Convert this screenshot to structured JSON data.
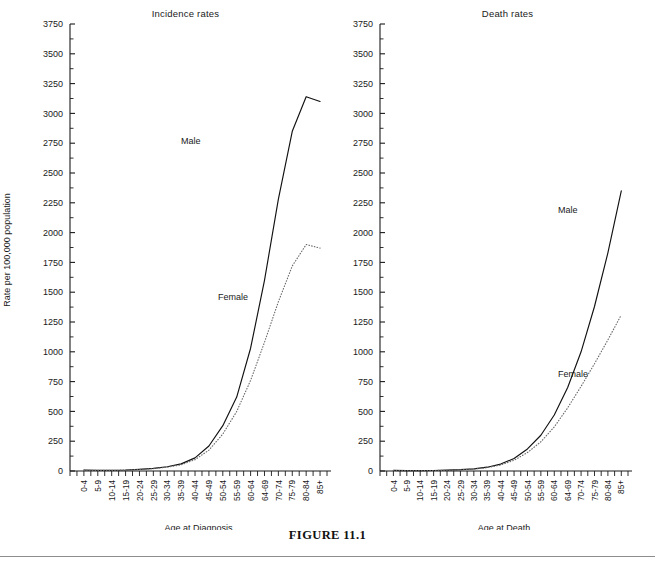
{
  "figure": {
    "caption": "FIGURE 11.1",
    "ylabel": "Rate per 100,000 population"
  },
  "chart_data": [
    {
      "type": "line",
      "panel_id": "incidence",
      "title": "Incidence rates",
      "xlabel": "Age at Diagnosis",
      "ylabel": "Rate per 100,000 population",
      "ylim": [
        0,
        3750
      ],
      "ytick_step": 250,
      "yticks": [
        0,
        250,
        500,
        750,
        1000,
        1250,
        1500,
        1750,
        2000,
        2250,
        2500,
        2750,
        3000,
        3250,
        3500,
        3750
      ],
      "grid": false,
      "legend_position": "inline-annotation",
      "categories": [
        "0-4",
        "5-9",
        "10-14",
        "15-19",
        "20-24",
        "25-29",
        "30-34",
        "35-39",
        "40-44",
        "45-49",
        "50-54",
        "55-59",
        "60-64",
        "64-69",
        "70-74",
        "75-79",
        "80-84",
        "85+"
      ],
      "series": [
        {
          "name": "Male",
          "style": "solid",
          "values": [
            8,
            5,
            5,
            8,
            14,
            22,
            36,
            60,
            110,
            210,
            380,
            620,
            1030,
            1600,
            2280,
            2850,
            3140,
            3100
          ]
        },
        {
          "name": "Female",
          "style": "dotted",
          "values": [
            7,
            5,
            5,
            8,
            13,
            20,
            32,
            52,
            95,
            175,
            310,
            500,
            760,
            1080,
            1420,
            1720,
            1900,
            1870
          ]
        }
      ],
      "annotations": [
        {
          "text": "Male",
          "series": "Male"
        },
        {
          "text": "Female",
          "series": "Female"
        }
      ]
    },
    {
      "type": "line",
      "panel_id": "death",
      "title": "Death rates",
      "xlabel": "Age at Death",
      "ylabel": "Rate per 100,000 population",
      "ylim": [
        0,
        3750
      ],
      "ytick_step": 250,
      "yticks": [
        0,
        250,
        500,
        750,
        1000,
        1250,
        1500,
        1750,
        2000,
        2250,
        2500,
        2750,
        3000,
        3250,
        3500,
        3750
      ],
      "grid": false,
      "legend_position": "inline-annotation",
      "categories": [
        "0-4",
        "5-9",
        "10-14",
        "15-19",
        "20-24",
        "25-29",
        "30-34",
        "35-39",
        "40-44",
        "45-49",
        "50-54",
        "55-59",
        "60-64",
        "64-69",
        "70-74",
        "75-79",
        "80-84",
        "85+"
      ],
      "series": [
        {
          "name": "Male",
          "style": "solid",
          "values": [
            5,
            3,
            3,
            4,
            7,
            11,
            18,
            32,
            58,
            105,
            185,
            300,
            470,
            700,
            1000,
            1380,
            1830,
            2350
          ]
        },
        {
          "name": "Female",
          "style": "dotted",
          "values": [
            4,
            3,
            3,
            4,
            6,
            10,
            16,
            28,
            50,
            90,
            155,
            245,
            370,
            530,
            710,
            900,
            1100,
            1310
          ]
        }
      ],
      "annotations": [
        {
          "text": "Male",
          "series": "Male"
        },
        {
          "text": "Female",
          "series": "Female"
        }
      ]
    }
  ]
}
